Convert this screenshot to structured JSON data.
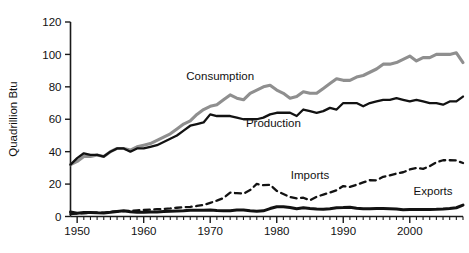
{
  "chart_data": {
    "type": "line",
    "title": "",
    "xlabel": "",
    "ylabel": "Quadrillion Btu",
    "xlim": [
      1949,
      2008
    ],
    "ylim": [
      0,
      120
    ],
    "yticks": [
      0,
      20,
      40,
      60,
      80,
      100,
      120
    ],
    "xticks": [
      1950,
      1960,
      1970,
      1980,
      1990,
      2000
    ],
    "ytick_labels": [
      "0",
      "20",
      "40",
      "60",
      "80",
      "100",
      "120"
    ],
    "xtick_labels": [
      "1950",
      "1960",
      "1970",
      "1980",
      "1990",
      "2000"
    ],
    "grid": false,
    "legend": "inline-annotations",
    "annotations": [
      {
        "name": "consumption-label",
        "text": "Consumption",
        "x": 1971.5,
        "y": 84
      },
      {
        "name": "production-label",
        "text": "Production",
        "x": 1979.5,
        "y": 55
      },
      {
        "name": "imports-label",
        "text": "Imports",
        "x": 1985.0,
        "y": 23
      },
      {
        "name": "exports-label",
        "text": "Exports",
        "x": 2003.5,
        "y": 13
      }
    ],
    "colors": {
      "consumption": "#8f8f8f",
      "production": "#121212",
      "imports": "#121212",
      "exports": "#121212",
      "axis": "#1a1a1a",
      "background": "#ffffff"
    },
    "x": [
      1949,
      1950,
      1951,
      1952,
      1953,
      1954,
      1955,
      1956,
      1957,
      1958,
      1959,
      1960,
      1961,
      1962,
      1963,
      1964,
      1965,
      1966,
      1967,
      1968,
      1969,
      1970,
      1971,
      1972,
      1973,
      1974,
      1975,
      1976,
      1977,
      1978,
      1979,
      1980,
      1981,
      1982,
      1983,
      1984,
      1985,
      1986,
      1987,
      1988,
      1989,
      1990,
      1991,
      1992,
      1993,
      1994,
      1995,
      1996,
      1997,
      1998,
      1999,
      2000,
      2001,
      2002,
      2003,
      2004,
      2005,
      2006,
      2007,
      2008
    ],
    "series": [
      {
        "name": "Consumption",
        "style": "solid-thick-gray",
        "values": [
          32,
          34,
          37,
          37,
          38,
          37,
          40,
          42,
          42,
          41,
          43,
          44,
          45,
          47,
          49,
          51,
          54,
          57,
          59,
          63,
          66,
          68,
          69,
          72,
          75,
          73,
          72,
          76,
          78,
          80,
          81,
          78,
          76,
          73,
          74,
          77,
          76,
          76,
          79,
          82,
          85,
          84,
          84,
          86,
          87,
          89,
          91,
          94,
          94,
          95,
          97,
          99,
          96,
          98,
          98,
          100,
          100,
          100,
          101,
          95
        ]
      },
      {
        "name": "Production",
        "style": "solid-black",
        "values": [
          32,
          36,
          39,
          38,
          38,
          37,
          40,
          42,
          42,
          40,
          42,
          42,
          43,
          44,
          46,
          48,
          50,
          53,
          56,
          57,
          58,
          63,
          62,
          62,
          62,
          61,
          60,
          60,
          60,
          61,
          63,
          64,
          64,
          64,
          62,
          66,
          65,
          64,
          65,
          67,
          66,
          70,
          70,
          70,
          68,
          70,
          71,
          72,
          72,
          73,
          72,
          71,
          72,
          71,
          70,
          70,
          69,
          71,
          71,
          74
        ]
      },
      {
        "name": "Imports",
        "style": "dashed-black",
        "values": [
          1.5,
          1.9,
          2.0,
          2.2,
          2.4,
          2.3,
          2.9,
          3.2,
          3.3,
          3.5,
          3.8,
          4.0,
          4.2,
          4.5,
          4.7,
          5.0,
          5.4,
          5.8,
          5.9,
          6.5,
          7.1,
          8.4,
          9.8,
          11.4,
          14.7,
          14.4,
          14.1,
          16.3,
          20.1,
          19.3,
          19.6,
          15.8,
          13.9,
          12.0,
          11.2,
          11.6,
          10.0,
          12.2,
          13.5,
          14.8,
          16.2,
          18.8,
          18.3,
          19.6,
          21.0,
          22.4,
          22.3,
          24.5,
          25.4,
          26.5,
          27.3,
          29.0,
          30.0,
          29.4,
          31.1,
          33.5,
          34.7,
          34.7,
          34.6,
          33.0
        ]
      },
      {
        "name": "Exports",
        "style": "solid-black-thick",
        "values": [
          2.8,
          2.0,
          2.5,
          2.5,
          2.3,
          2.2,
          2.6,
          3.1,
          3.5,
          2.9,
          2.6,
          2.6,
          2.7,
          2.8,
          3.1,
          3.3,
          3.4,
          3.5,
          3.8,
          3.9,
          3.9,
          4.0,
          3.7,
          3.5,
          3.6,
          4.0,
          4.0,
          3.5,
          3.3,
          3.5,
          4.9,
          6.0,
          6.0,
          5.5,
          4.8,
          5.4,
          5.0,
          4.7,
          4.5,
          4.8,
          5.4,
          5.5,
          5.7,
          5.1,
          4.8,
          4.8,
          5.0,
          5.0,
          4.8,
          4.6,
          4.2,
          4.3,
          4.3,
          4.3,
          4.3,
          4.4,
          4.6,
          4.9,
          5.4,
          7.0
        ]
      }
    ]
  }
}
